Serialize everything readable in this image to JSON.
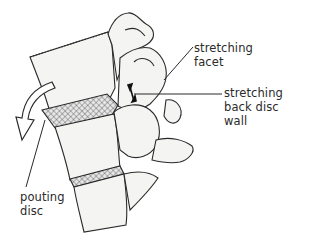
{
  "figure": {
    "labels": {
      "stretching_facet": "stretching\nfacet",
      "stretching_back_disc_wall": "stretching\nback disc\nwall",
      "pouting_disc": "pouting\ndisc"
    },
    "colors": {
      "ink": "#2a2a2a",
      "bone_fill": "#f4f4f2",
      "disc_fill": "#d9d9d9",
      "background": "#ffffff"
    }
  }
}
